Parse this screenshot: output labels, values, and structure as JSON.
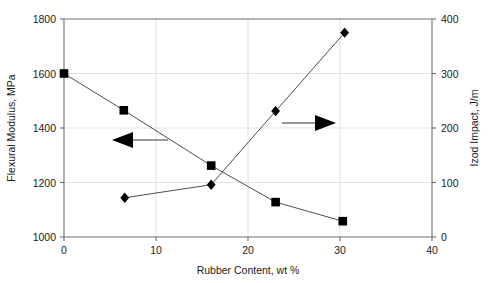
{
  "chart_data": {
    "type": "line",
    "title": "",
    "xlabel": "Rubber Content, wt %",
    "ylabel": "Flexural Modulus, MPa",
    "y2label": "Izod Impact, J/m",
    "xlim": [
      0,
      40
    ],
    "ylim": [
      1000,
      1800
    ],
    "y2lim": [
      0,
      400
    ],
    "xticks": [
      0,
      10,
      20,
      30,
      40
    ],
    "xtick_labels": [
      "0",
      "10",
      "20",
      "30",
      "40"
    ],
    "yticks": [
      1000,
      1200,
      1400,
      1600,
      1800
    ],
    "ytick_labels": [
      "1000",
      "1200",
      "1400",
      "1600",
      "1800"
    ],
    "y2ticks": [
      0,
      100,
      200,
      300,
      400
    ],
    "y2tick_labels": [
      "0",
      "100",
      "200",
      "300",
      "400"
    ],
    "grid": true,
    "legend": "none",
    "series": [
      {
        "name": "Flexural Modulus, MPa",
        "axis": "left",
        "marker": "square",
        "color": "#000000",
        "points": [
          {
            "x": 0,
            "y": 1600
          },
          {
            "x": 6.5,
            "y": 1465
          },
          {
            "x": 16.0,
            "y": 1262
          },
          {
            "x": 23.0,
            "y": 1128
          },
          {
            "x": 30.3,
            "y": 1058
          }
        ]
      },
      {
        "name": "Izod Impact, J/m",
        "axis": "right",
        "marker": "diamond",
        "color": "#000000",
        "points": [
          {
            "x": 6.6,
            "y": 72
          },
          {
            "x": 16.0,
            "y": 96
          },
          {
            "x": 23.0,
            "y": 231
          },
          {
            "x": 30.5,
            "y": 375
          }
        ]
      }
    ],
    "annotations": [
      {
        "name": "left-axis-arrow",
        "direction": "left",
        "label": "",
        "points_to": "left-axis"
      },
      {
        "name": "right-axis-arrow",
        "direction": "right",
        "label": "",
        "points_to": "right-axis"
      }
    ]
  }
}
